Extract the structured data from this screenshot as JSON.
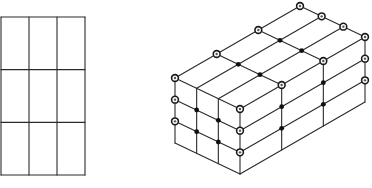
{
  "figure": {
    "colors": {
      "line": "#2a2a2a",
      "node_fill": "#111111",
      "background": "#ffffff"
    },
    "flat_grid": {
      "columns": 3,
      "rows": 3,
      "bounds": {
        "x": 1,
        "y": 17,
        "width": 84,
        "height": 158
      }
    },
    "isometric_block": {
      "columns_left_face": 3,
      "columns_right_face": 3,
      "rows": 3,
      "corners": {
        "front_top": [
          240,
          109
        ],
        "left_top": [
          175,
          78
        ],
        "back_top": [
          301,
          5
        ],
        "right_top": [
          365,
          37
        ],
        "front_bottom": [
          241,
          174
        ]
      },
      "node_types": {
        "boundary_nodes": "open circle",
        "interior_nodes": "filled dot"
      }
    }
  }
}
